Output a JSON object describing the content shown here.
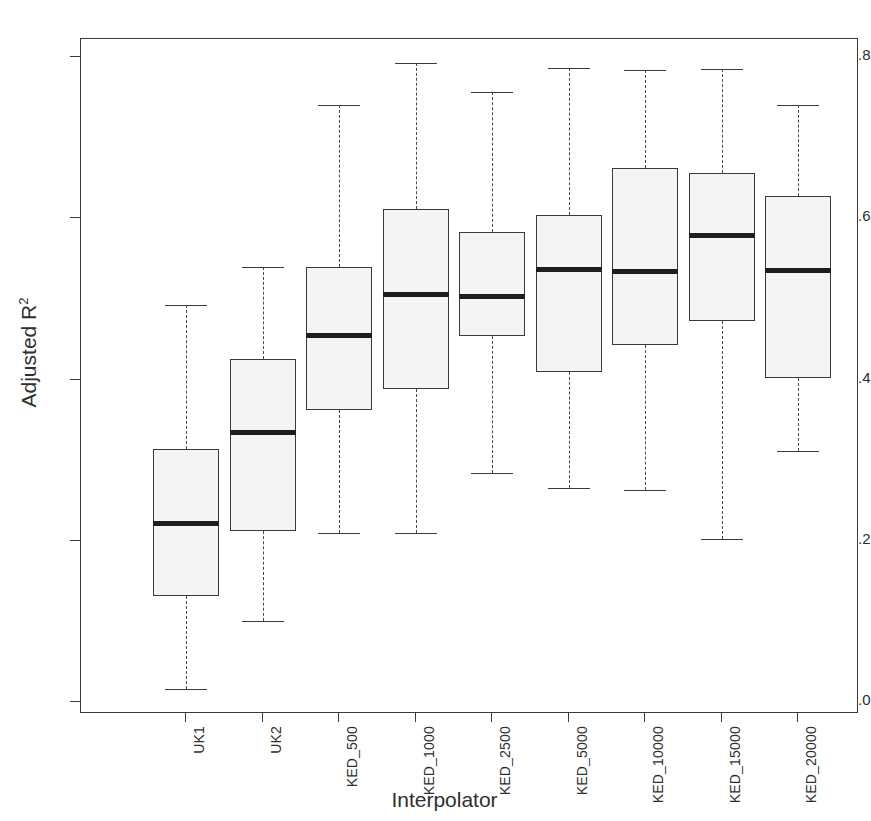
{
  "chart_data": {
    "type": "box",
    "title": "",
    "xlabel": "Interpolator",
    "ylabel": "Adjusted R2",
    "ylabel_base": "Adjusted R",
    "ylabel_exponent": "2",
    "categories": [
      "UK1",
      "UK2",
      "KED_500",
      "KED_1000",
      "KED_2500",
      "KED_5000",
      "KED_10000",
      "KED_15000",
      "KED_20000"
    ],
    "ylim": [
      0.0,
      0.82
    ],
    "ytick_labels": [
      "0.0",
      "0.2",
      "0.4",
      "0.6",
      "0.8"
    ],
    "ytick_values": [
      0.0,
      0.2,
      0.4,
      0.6,
      0.8
    ],
    "grid": false,
    "legend": "none",
    "boxes": [
      {
        "category": "UK1",
        "whisker_low": 0.016,
        "q1": 0.131,
        "median": 0.222,
        "q3": 0.314,
        "whisker_high": 0.492
      },
      {
        "category": "UK2",
        "whisker_low": 0.101,
        "q1": 0.212,
        "median": 0.334,
        "q3": 0.425,
        "whisker_high": 0.539
      },
      {
        "category": "KED_500",
        "whisker_low": 0.209,
        "q1": 0.362,
        "median": 0.454,
        "q3": 0.54,
        "whisker_high": 0.74
      },
      {
        "category": "KED_1000",
        "whisker_low": 0.209,
        "q1": 0.388,
        "median": 0.506,
        "q3": 0.612,
        "whisker_high": 0.792
      },
      {
        "category": "KED_2500",
        "whisker_low": 0.284,
        "q1": 0.454,
        "median": 0.503,
        "q3": 0.583,
        "whisker_high": 0.756
      },
      {
        "category": "KED_5000",
        "whisker_low": 0.266,
        "q1": 0.409,
        "median": 0.537,
        "q3": 0.604,
        "whisker_high": 0.786
      },
      {
        "category": "KED_10000",
        "whisker_low": 0.263,
        "q1": 0.443,
        "median": 0.534,
        "q3": 0.662,
        "whisker_high": 0.784
      },
      {
        "category": "KED_15000",
        "whisker_low": 0.202,
        "q1": 0.472,
        "median": 0.578,
        "q3": 0.656,
        "whisker_high": 0.785
      },
      {
        "category": "KED_20000",
        "whisker_low": 0.311,
        "q1": 0.402,
        "median": 0.535,
        "q3": 0.627,
        "whisker_high": 0.74
      }
    ],
    "colors": {
      "box_fill": "#f4f4f4",
      "box_stroke": "#3a3a3a",
      "median": "#1e1e1e",
      "whisker": "#4a4a4a",
      "axis": "#3a3a3a",
      "text": "#2f2f2f",
      "background": "#ffffff"
    }
  }
}
